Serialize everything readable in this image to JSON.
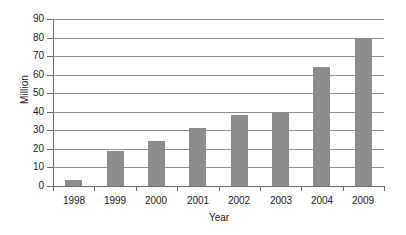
{
  "chart_data": {
    "type": "bar",
    "title": "",
    "subtitle": "",
    "xlabel": "Year",
    "ylabel": "Million",
    "categories": [
      "1998",
      "1999",
      "2000",
      "2001",
      "2002",
      "2003",
      "2004",
      "2009"
    ],
    "values": [
      3,
      19,
      24.5,
      31,
      38,
      40,
      64,
      80
    ],
    "series": [
      {
        "name": "Million",
        "values": [
          3,
          19,
          24.5,
          31,
          38,
          40,
          64,
          80
        ]
      }
    ],
    "ylim": [
      0,
      90
    ],
    "ytick_labels": [
      "0",
      "10",
      "20",
      "30",
      "40",
      "50",
      "60",
      "70",
      "80",
      "90"
    ],
    "ytick_values": [
      0,
      10,
      20,
      30,
      40,
      50,
      60,
      70,
      80,
      90
    ],
    "grid": true,
    "grid_axis": "y",
    "legend": false,
    "legend_position": "none",
    "annotations": [],
    "colors": {
      "bar": "#8c8c8c",
      "gridline": "#8f8f8f",
      "axis": "#6b6b6b",
      "text": "#1a1a1a",
      "background": "#ffffff"
    }
  }
}
